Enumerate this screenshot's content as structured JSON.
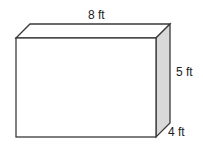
{
  "diagram": {
    "type": "rectangular-prism",
    "labels": {
      "length": "8 ft",
      "height": "5 ft",
      "depth": "4 ft"
    },
    "colors": {
      "edge": "#3a3a3a",
      "front_face": "#ffffff",
      "top_face": "#ffffff",
      "side_face": "#d9d9d9"
    }
  }
}
